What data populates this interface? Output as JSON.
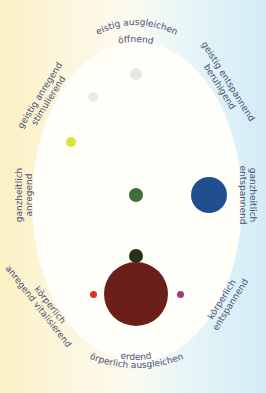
{
  "diagram": {
    "title": "",
    "labels": {
      "top_line1": "geistig ausgleichend",
      "top_line2": "öffnend",
      "upper_left_line1": "geistig anregend",
      "upper_left_line2": "stimulierend",
      "upper_right_line1": "geistig entspannend",
      "upper_right_line2": "beruhigend",
      "left_line1": "ganzheitlich",
      "left_line2": "anregend",
      "right_line1": "ganzheitlich",
      "right_line2": "entspannend",
      "lower_left_line1": "körperlich",
      "lower_left_line2": "anregend vitalisierend",
      "lower_right_line1": "körperlich",
      "lower_right_line2": "entspannend",
      "bottom_line1": "erdend",
      "bottom_line2": "körperlich ausgleichend"
    },
    "dots": [
      {
        "name": "top-center-dot",
        "color": "#e4ebe3",
        "cx": 136,
        "cy": 74,
        "r": 6
      },
      {
        "name": "upper-left-dot",
        "color": "#e6eee0",
        "cx": 93,
        "cy": 97,
        "r": 5
      },
      {
        "name": "left-yellow-dot",
        "color": "#dce23a",
        "cx": 71,
        "cy": 142,
        "r": 5
      },
      {
        "name": "center-green-dot",
        "color": "#3f6e3a",
        "cx": 136,
        "cy": 195,
        "r": 7
      },
      {
        "name": "right-blue-dot",
        "color": "#1f4f8f",
        "cx": 209,
        "cy": 195,
        "r": 18
      },
      {
        "name": "lower-dark-green-dot",
        "color": "#26301c",
        "cx": 136,
        "cy": 256,
        "r": 7
      },
      {
        "name": "bottom-brown-dot",
        "color": "#6a1f1a",
        "cx": 136,
        "cy": 294,
        "r": 32
      },
      {
        "name": "red-dot",
        "color": "#e0361f",
        "cx": 93,
        "cy": 294,
        "r": 3.5
      },
      {
        "name": "magenta-dot",
        "color": "#a33d74",
        "cx": 180,
        "cy": 294,
        "r": 3.5
      }
    ],
    "colors": {
      "background_left": "#fbf1c4",
      "background_right": "#d3ecf6",
      "ellipse": "#fffef8",
      "label_text": "#4b4f78"
    }
  }
}
